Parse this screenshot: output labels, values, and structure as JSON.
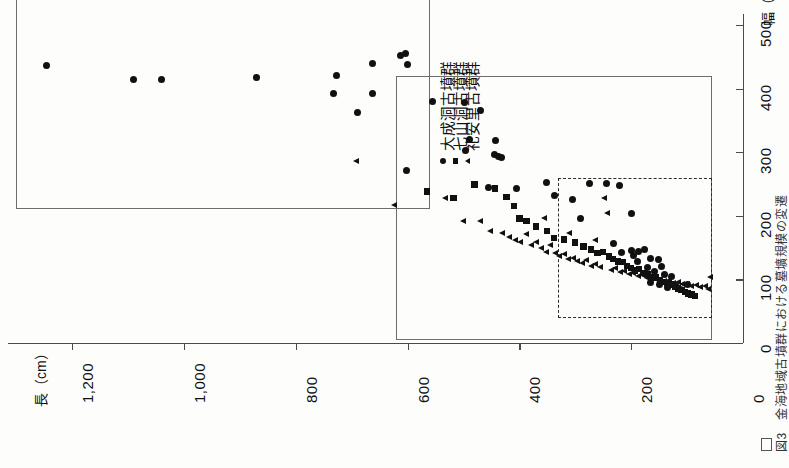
{
  "figure": {
    "orientation": "rotated-90-ccw",
    "caption_fragment": "図3　金海地域古墳群における墓壙規模の変遷"
  },
  "axes": {
    "length": {
      "title": "長（cm）",
      "unit": "cm",
      "ticks": [
        1200,
        1000,
        800,
        600,
        400,
        200,
        0
      ],
      "tick_labels": [
        "1,200",
        "1,000",
        "800",
        "600",
        "400",
        "200",
        "0"
      ],
      "range": [
        0,
        1300
      ],
      "direction": "right-to-left"
    },
    "width": {
      "title": "幅（cm）",
      "unit": "cm",
      "ticks": [
        100,
        200,
        300,
        400,
        500
      ],
      "tick_labels": [
        "100",
        "200",
        "300",
        "400",
        "500"
      ],
      "range": [
        0,
        560
      ],
      "direction": "bottom-to-top"
    }
  },
  "legend": {
    "position": "top-center-right",
    "entries": [
      {
        "label": "大成洞古墳群",
        "marker": "circle"
      },
      {
        "label": "七山洞古墳群",
        "marker": "square"
      },
      {
        "label": "礼安里古墳群",
        "marker": "triangle"
      }
    ]
  },
  "groups": [
    {
      "name": "large-tomb-group-box",
      "style": "solid",
      "length_range": [
        560,
        1300
      ],
      "width_range": [
        210,
        560
      ]
    },
    {
      "name": "medium-tomb-group-box",
      "style": "solid",
      "length_range": [
        55,
        620
      ],
      "width_range": [
        5,
        420
      ]
    },
    {
      "name": "small-tomb-group-box",
      "style": "dashed",
      "length_range": [
        55,
        330
      ],
      "width_range": [
        40,
        260
      ]
    }
  ],
  "chart_data": {
    "type": "scatter",
    "xlabel": "長（cm）",
    "ylabel": "幅（cm）",
    "xlim": [
      0,
      1300
    ],
    "ylim": [
      0,
      560
    ],
    "grid": false,
    "legend_position": "top-right",
    "note": "x axis (長) increases right-to-left; y axis (幅) increases upward on the rotated page",
    "series": [
      {
        "name": "大成洞古墳群",
        "marker": "circle",
        "points": [
          [
            1245,
            437
          ],
          [
            1090,
            415
          ],
          [
            1040,
            415
          ],
          [
            870,
            417
          ],
          [
            727,
            420
          ],
          [
            733,
            393
          ],
          [
            662,
            440
          ],
          [
            663,
            392
          ],
          [
            612,
            452
          ],
          [
            600,
            438
          ],
          [
            603,
            455
          ],
          [
            690,
            362
          ],
          [
            602,
            271
          ],
          [
            470,
            365
          ],
          [
            555,
            380
          ],
          [
            498,
            378
          ],
          [
            490,
            320
          ],
          [
            497,
            303
          ],
          [
            443,
            318
          ],
          [
            444,
            296
          ],
          [
            437,
            294
          ],
          [
            432,
            292
          ],
          [
            405,
            243
          ],
          [
            456,
            245
          ],
          [
            352,
            253
          ],
          [
            337,
            232
          ],
          [
            275,
            251
          ],
          [
            305,
            226
          ],
          [
            290,
            196
          ],
          [
            245,
            251
          ],
          [
            220,
            248
          ],
          [
            200,
            204
          ],
          [
            232,
            156
          ],
          [
            218,
            142
          ],
          [
            200,
            146
          ],
          [
            195,
            138
          ],
          [
            186,
            144
          ],
          [
            176,
            147
          ],
          [
            188,
            128
          ],
          [
            165,
            133
          ],
          [
            152,
            131
          ],
          [
            170,
            118
          ],
          [
            158,
            113
          ],
          [
            145,
            120
          ],
          [
            140,
            107
          ],
          [
            128,
            105
          ],
          [
            165,
            95
          ],
          [
            150,
            92
          ],
          [
            135,
            88
          ],
          [
            120,
            90
          ],
          [
            112,
            84
          ],
          [
            100,
            92
          ]
        ]
      },
      {
        "name": "七山洞古墳群",
        "marker": "square",
        "points": [
          [
            565,
            238
          ],
          [
            518,
            228
          ],
          [
            480,
            249
          ],
          [
            443,
            243
          ],
          [
            423,
            230
          ],
          [
            410,
            215
          ],
          [
            400,
            196
          ],
          [
            387,
            192
          ],
          [
            370,
            183
          ],
          [
            350,
            176
          ],
          [
            338,
            165
          ],
          [
            320,
            163
          ],
          [
            300,
            158
          ],
          [
            285,
            152
          ],
          [
            272,
            147
          ],
          [
            260,
            142
          ],
          [
            250,
            143
          ],
          [
            240,
            136
          ],
          [
            232,
            132
          ],
          [
            224,
            128
          ],
          [
            215,
            127
          ],
          [
            208,
            121
          ],
          [
            200,
            118
          ],
          [
            193,
            114
          ],
          [
            186,
            116
          ],
          [
            178,
            110
          ],
          [
            170,
            108
          ],
          [
            163,
            104
          ],
          [
            156,
            103
          ],
          [
            148,
            99
          ],
          [
            142,
            96
          ],
          [
            136,
            94
          ],
          [
            128,
            92
          ],
          [
            122,
            88
          ],
          [
            116,
            86
          ],
          [
            110,
            83
          ],
          [
            104,
            80
          ],
          [
            98,
            78
          ],
          [
            92,
            76
          ],
          [
            86,
            74
          ]
        ]
      },
      {
        "name": "礼安里古墳群",
        "marker": "triangle",
        "points": [
          [
            692,
            285
          ],
          [
            623,
            215
          ],
          [
            532,
            226
          ],
          [
            500,
            190
          ],
          [
            470,
            190
          ],
          [
            452,
            175
          ],
          [
            430,
            172
          ],
          [
            418,
            166
          ],
          [
            408,
            160
          ],
          [
            398,
            157
          ],
          [
            388,
            170
          ],
          [
            378,
            152
          ],
          [
            370,
            158
          ],
          [
            360,
            148
          ],
          [
            352,
            142
          ],
          [
            344,
            152
          ],
          [
            336,
            140
          ],
          [
            328,
            135
          ],
          [
            320,
            138
          ],
          [
            312,
            130
          ],
          [
            304,
            133
          ],
          [
            296,
            127
          ],
          [
            288,
            124
          ],
          [
            280,
            129
          ],
          [
            272,
            120
          ],
          [
            264,
            123
          ],
          [
            256,
            118
          ],
          [
            248,
            227
          ],
          [
            243,
            203
          ],
          [
            236,
            113
          ],
          [
            228,
            116
          ],
          [
            220,
            110
          ],
          [
            212,
            112
          ],
          [
            204,
            107
          ],
          [
            196,
            109
          ],
          [
            188,
            104
          ],
          [
            180,
            106
          ],
          [
            172,
            101
          ],
          [
            164,
            103
          ],
          [
            156,
            99
          ],
          [
            148,
            100
          ],
          [
            140,
            96
          ],
          [
            132,
            97
          ],
          [
            124,
            93
          ],
          [
            116,
            95
          ],
          [
            108,
            91
          ],
          [
            100,
            92
          ],
          [
            92,
            88
          ],
          [
            84,
            90
          ],
          [
            76,
            86
          ],
          [
            68,
            88
          ],
          [
            62,
            84
          ],
          [
            58,
            102
          ],
          [
            355,
            195
          ],
          [
            310,
            172
          ],
          [
            265,
            160
          ]
        ]
      }
    ]
  }
}
